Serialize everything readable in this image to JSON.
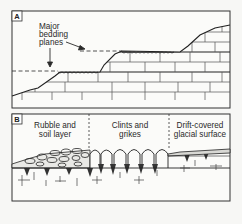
{
  "panels": [
    {
      "id": "A",
      "tag": "A",
      "annotation": {
        "lines": [
          "Major",
          "bedding",
          "planes"
        ]
      }
    },
    {
      "id": "B",
      "tag": "B",
      "zones": [
        {
          "lines": [
            "Rubble and",
            "soil layer"
          ]
        },
        {
          "lines": [
            "Clints and",
            "grikes"
          ]
        },
        {
          "lines": [
            "Drift-covered",
            "glacial surface"
          ]
        }
      ]
    }
  ],
  "colors": {
    "ink": "#2a2a2a",
    "paper": "#f7f7f5",
    "frame": "#333333"
  }
}
